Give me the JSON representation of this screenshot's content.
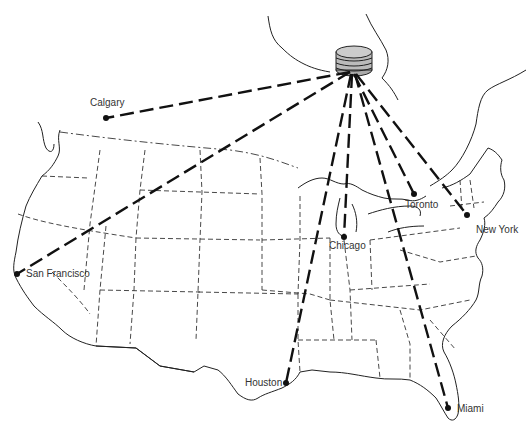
{
  "map": {
    "title": "",
    "description": "Satellite broadcast links from a geostationary satellite to North American cities",
    "satellite": {
      "name": "satellite",
      "x": 353,
      "y": 72
    },
    "cities": [
      {
        "id": "calgary",
        "label": "Calgary",
        "x": 106,
        "y": 118,
        "label_x": 90,
        "label_y": 97
      },
      {
        "id": "san-francisco",
        "label": "San Francisco",
        "x": 17,
        "y": 274,
        "label_x": 26,
        "label_y": 268
      },
      {
        "id": "chicago",
        "label": "Chicago",
        "x": 344,
        "y": 237,
        "label_x": 329,
        "label_y": 240
      },
      {
        "id": "toronto",
        "label": "Toronto",
        "x": 414,
        "y": 194,
        "label_x": 405,
        "label_y": 199
      },
      {
        "id": "new-york",
        "label": "New York",
        "x": 467,
        "y": 215,
        "label_x": 476,
        "label_y": 224
      },
      {
        "id": "houston",
        "label": "Houston",
        "x": 286,
        "y": 383,
        "label_x": 245,
        "label_y": 377
      },
      {
        "id": "miami",
        "label": "Miami",
        "x": 448,
        "y": 408,
        "label_x": 457,
        "label_y": 403
      }
    ],
    "colors": {
      "line": "#111111",
      "border": "#333333",
      "background": "#ffffff"
    }
  }
}
